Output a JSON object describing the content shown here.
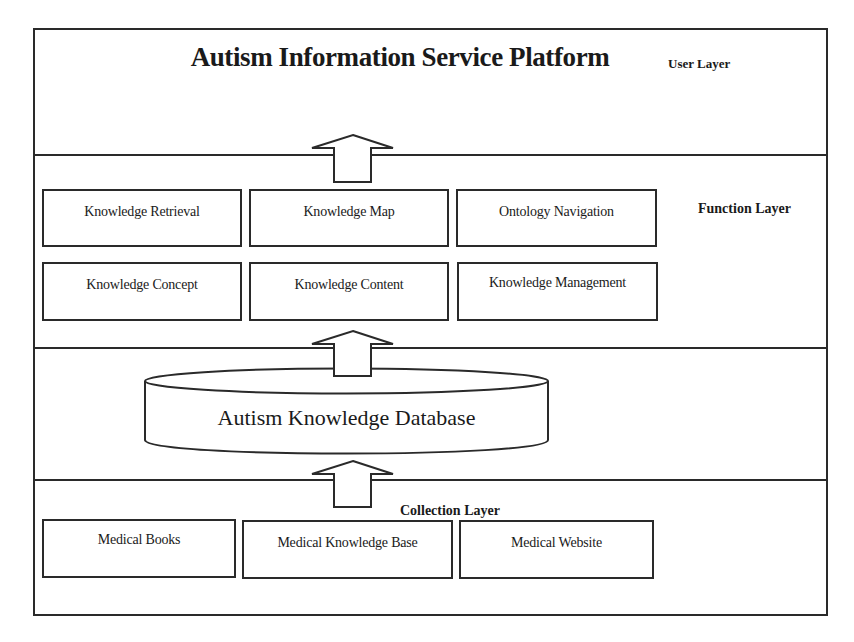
{
  "diagram": {
    "title": "Autism Information Service Platform",
    "layers": {
      "user": {
        "label": "User Layer"
      },
      "function": {
        "label": "Function Layer",
        "modules": [
          {
            "label": "Knowledge Retrieval"
          },
          {
            "label": "Knowledge Map"
          },
          {
            "label": "Ontology Navigation"
          },
          {
            "label": "Knowledge Concept"
          },
          {
            "label": "Knowledge Content"
          },
          {
            "label": "Knowledge Management"
          }
        ]
      },
      "data": {
        "database": {
          "label": "Autism Knowledge Database"
        }
      },
      "collection": {
        "label": "Collection Layer",
        "sources": [
          {
            "label": "Medical Books"
          },
          {
            "label": "Medical Knowledge Base"
          },
          {
            "label": "Medical Website"
          }
        ]
      }
    },
    "arrows": [
      {
        "from": "function-layer",
        "to": "user-layer",
        "icon": "arrow-up-icon"
      },
      {
        "from": "database",
        "to": "function-layer",
        "icon": "arrow-up-icon"
      },
      {
        "from": "collection-layer",
        "to": "database",
        "icon": "arrow-up-icon"
      }
    ],
    "colors": {
      "stroke": "#2a2a2a",
      "background": "#ffffff",
      "text": "#1a1a1a"
    }
  }
}
